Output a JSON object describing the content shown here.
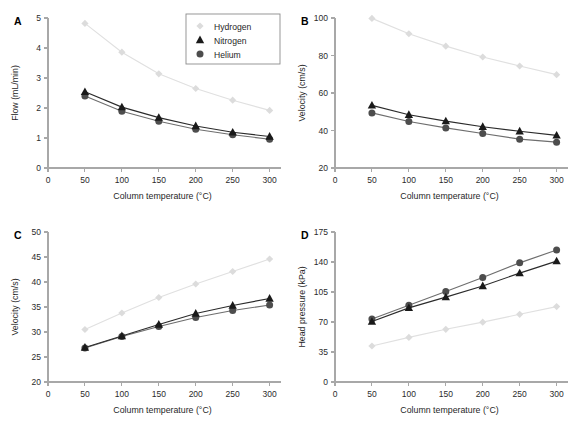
{
  "figure": {
    "background": "#ffffff",
    "panel_letters": [
      "A",
      "B",
      "C",
      "D"
    ]
  },
  "series_style": {
    "hydrogen": {
      "color": "#dcdcdc",
      "line": "#e0e0e0",
      "marker": "diamond"
    },
    "nitrogen": {
      "color": "#1a1a1a",
      "line": "#2b2b2b",
      "marker": "triangle"
    },
    "helium": {
      "color": "#4d4d4d",
      "line": "#6e6e6e",
      "marker": "circle"
    }
  },
  "legend": {
    "position": "top-right-panel-A",
    "entries": [
      {
        "key": "hydrogen",
        "label": "Hydrogen",
        "marker": "diamond"
      },
      {
        "key": "nitrogen",
        "label": "Nitrogen",
        "marker": "triangle"
      },
      {
        "key": "helium",
        "label": "Helium",
        "marker": "circle"
      }
    ]
  },
  "chart_data": [
    {
      "id": "panel-A",
      "panel": "A",
      "type": "line",
      "title": "",
      "xlabel": "Column temperature (°C)",
      "ylabel": "Flow (mL/min)",
      "x": [
        50,
        100,
        150,
        200,
        250,
        300
      ],
      "xlim": [
        0,
        310
      ],
      "xticks": [
        0,
        50,
        100,
        150,
        200,
        250,
        300
      ],
      "ylim": [
        0,
        5
      ],
      "yticks": [
        0,
        1,
        2,
        3,
        4,
        5
      ],
      "grid": false,
      "series": [
        {
          "name": "Hydrogen",
          "key": "hydrogen",
          "values": [
            4.82,
            3.86,
            3.14,
            2.65,
            2.26,
            1.92
          ]
        },
        {
          "name": "Nitrogen",
          "key": "nitrogen",
          "values": [
            2.54,
            2.03,
            1.68,
            1.4,
            1.19,
            1.05
          ]
        },
        {
          "name": "Helium",
          "key": "helium",
          "values": [
            2.4,
            1.89,
            1.56,
            1.29,
            1.11,
            0.96
          ]
        }
      ]
    },
    {
      "id": "panel-B",
      "panel": "B",
      "type": "line",
      "title": "",
      "xlabel": "Column temperature (°C)",
      "ylabel": "Velocity (cm/s)",
      "x": [
        50,
        100,
        150,
        200,
        250,
        300
      ],
      "xlim": [
        0,
        310
      ],
      "xticks": [
        0,
        50,
        100,
        150,
        200,
        250,
        300
      ],
      "ylim": [
        20,
        100
      ],
      "yticks": [
        20,
        40,
        60,
        80,
        100
      ],
      "grid": false,
      "series": [
        {
          "name": "Hydrogen",
          "key": "hydrogen",
          "values": [
            99.8,
            91.6,
            85.0,
            79.2,
            74.4,
            69.8
          ]
        },
        {
          "name": "Nitrogen",
          "key": "nitrogen",
          "values": [
            53.4,
            48.4,
            45.0,
            42.0,
            39.6,
            37.4
          ]
        },
        {
          "name": "Helium",
          "key": "helium",
          "values": [
            49.4,
            44.8,
            41.4,
            38.4,
            35.4,
            33.8
          ]
        }
      ]
    },
    {
      "id": "panel-C",
      "panel": "C",
      "type": "line",
      "title": "",
      "xlabel": "Column temperature (°C)",
      "ylabel": "Velocity (cm/s)",
      "x": [
        50,
        100,
        150,
        200,
        250,
        300
      ],
      "xlim": [
        0,
        310
      ],
      "xticks": [
        0,
        50,
        100,
        150,
        200,
        250,
        300
      ],
      "ylim": [
        20,
        50
      ],
      "yticks": [
        20,
        25,
        30,
        35,
        40,
        45,
        50
      ],
      "grid": false,
      "series": [
        {
          "name": "Hydrogen",
          "key": "hydrogen",
          "values": [
            30.5,
            33.8,
            36.9,
            39.6,
            42.1,
            44.6
          ]
        },
        {
          "name": "Nitrogen",
          "key": "nitrogen",
          "values": [
            26.9,
            29.2,
            31.5,
            33.7,
            35.3,
            36.7
          ]
        },
        {
          "name": "Helium",
          "key": "helium",
          "values": [
            26.8,
            29.1,
            31.1,
            32.9,
            34.3,
            35.4
          ]
        }
      ]
    },
    {
      "id": "panel-D",
      "panel": "D",
      "type": "line",
      "title": "",
      "xlabel": "Column temperature (°C)",
      "ylabel": "Head pressure (kPa)",
      "x": [
        50,
        100,
        150,
        200,
        250,
        300
      ],
      "xlim": [
        0,
        310
      ],
      "xticks": [
        0,
        50,
        100,
        150,
        200,
        250,
        300
      ],
      "ylim": [
        0,
        175
      ],
      "yticks": [
        0,
        35,
        70,
        105,
        140,
        175
      ],
      "grid": false,
      "series": [
        {
          "name": "Hydrogen",
          "key": "hydrogen",
          "values": [
            42.0,
            52.0,
            61.5,
            69.8,
            79.0,
            88.0
          ]
        },
        {
          "name": "Nitrogen",
          "key": "nitrogen",
          "values": [
            70.5,
            86.5,
            99.0,
            112.0,
            127.0,
            141.0
          ]
        },
        {
          "name": "Helium",
          "key": "helium",
          "values": [
            73.5,
            89.5,
            105.5,
            122.0,
            139.0,
            154.0
          ]
        }
      ]
    }
  ]
}
